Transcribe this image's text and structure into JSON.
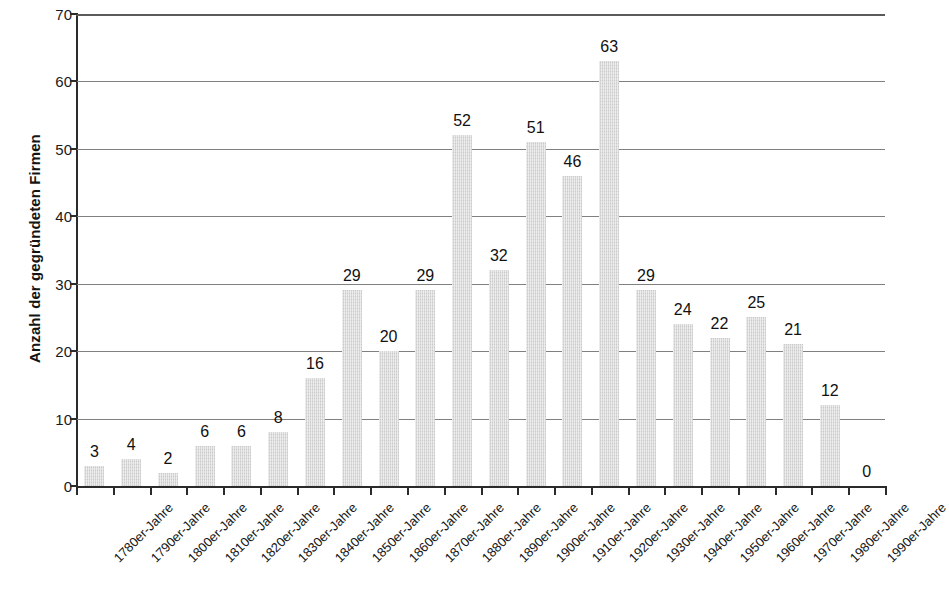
{
  "chart_data": {
    "type": "bar",
    "title": "",
    "xlabel": "",
    "ylabel": "Anzahl der gegründeten Firmen",
    "ylim": [
      0,
      70
    ],
    "y_ticks": [
      0,
      10,
      20,
      30,
      40,
      50,
      60,
      70
    ],
    "grid": true,
    "legend": "none",
    "bar_color": "#d8d8d8",
    "axis_color": "#2b2b2b",
    "label_color": "#111111",
    "categories": [
      "1780er-Jahre",
      "1790er-Jahre",
      "1800er-Jahre",
      "1810er-Jahre",
      "1820er-Jahre",
      "1830er-Jahre",
      "1840er-Jahre",
      "1850er-Jahre",
      "1860er-Jahre",
      "1870er-Jahre",
      "1880er-Jahre",
      "1890er-Jahre",
      "1900er-Jahre",
      "1910er-Jahre",
      "1920er-Jahre",
      "1930er-Jahre",
      "1940er-Jahre",
      "1950er-Jahre",
      "1960er-Jahre",
      "1970er-Jahre",
      "1980er-Jahre",
      "1990er-Jahre"
    ],
    "values": [
      3,
      4,
      2,
      6,
      6,
      8,
      16,
      29,
      20,
      29,
      52,
      32,
      51,
      46,
      63,
      29,
      24,
      22,
      25,
      21,
      12,
      0
    ],
    "value_labels": [
      "3",
      "4",
      "2",
      "6",
      "6",
      "8",
      "16",
      "29",
      "20",
      "29",
      "52",
      "32",
      "51",
      "46",
      "63",
      "29",
      "24",
      "22",
      "25",
      "21",
      "12",
      "0"
    ],
    "y_tick_labels": [
      "0",
      "10",
      "20",
      "30",
      "40",
      "50",
      "60",
      "70"
    ]
  }
}
